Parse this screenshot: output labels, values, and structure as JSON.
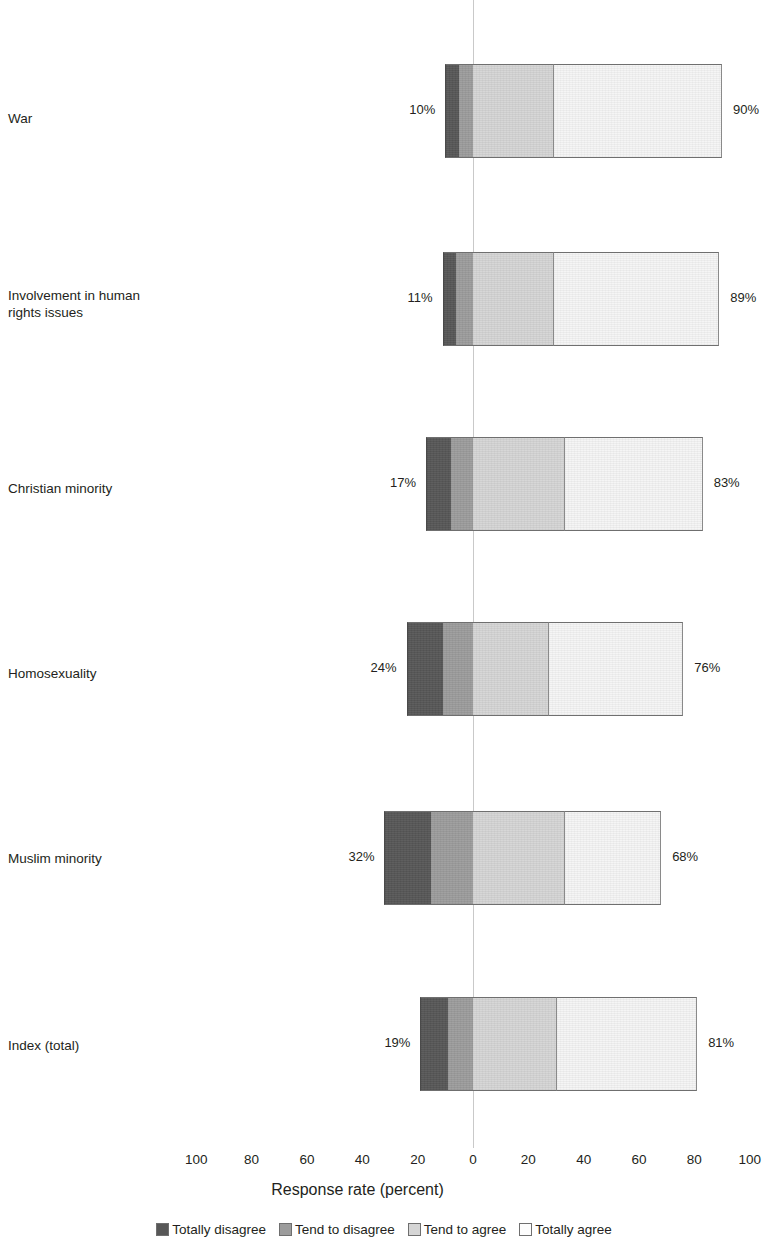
{
  "chart_data": {
    "type": "bar",
    "subtype": "diverging-stacked-bar",
    "title": "",
    "xlabel": "Response rate (percent)",
    "ylabel": "",
    "xlim": [
      -100,
      100
    ],
    "xticks": [
      "100",
      "80",
      "60",
      "40",
      "20",
      "0",
      "20",
      "40",
      "60",
      "80",
      "100"
    ],
    "grid": false,
    "zero_line": true,
    "legend_position": "bottom",
    "legend": [
      "Totally disagree",
      "Tend to disagree",
      "Tend to agree",
      "Totally agree"
    ],
    "colors": {
      "totally_disagree": "#575757",
      "tend_to_disagree": "#9c9c9c",
      "tend_to_agree": "#d5d5d5",
      "totally_agree": "#f5f5f5",
      "zero_line": "#c9c9c9",
      "text": "#231f20"
    },
    "categories": [
      "War",
      "Involvement in human\nrights issues",
      "Christian minority",
      "Homosexuality",
      "Muslim minority",
      "Index (total)"
    ],
    "series": [
      {
        "name": "Totally disagree",
        "values": [
          5,
          5,
          9,
          13,
          17,
          10
        ]
      },
      {
        "name": "Tend to disagree",
        "values": [
          5,
          6,
          8,
          11,
          15,
          9
        ]
      },
      {
        "name": "Tend to agree",
        "values": [
          29,
          29,
          33,
          27,
          33,
          30
        ]
      },
      {
        "name": "Totally agree",
        "values": [
          61,
          60,
          50,
          49,
          35,
          51
        ]
      }
    ],
    "rows": [
      {
        "label": "War",
        "disagree_total": "10%",
        "agree_total": "90%",
        "segments": [
          5,
          5,
          29,
          61
        ]
      },
      {
        "label": "Involvement in human\nrights issues",
        "disagree_total": "11%",
        "agree_total": "89%",
        "segments": [
          5,
          6,
          29,
          60
        ]
      },
      {
        "label": "Christian minority",
        "disagree_total": "17%",
        "agree_total": "83%",
        "segments": [
          9,
          8,
          33,
          50
        ]
      },
      {
        "label": "Homosexuality",
        "disagree_total": "24%",
        "agree_total": "76%",
        "segments": [
          13,
          11,
          27,
          49
        ]
      },
      {
        "label": "Muslim minority",
        "disagree_total": "32%",
        "agree_total": "68%",
        "segments": [
          17,
          15,
          33,
          35
        ]
      },
      {
        "label": "Index (total)",
        "disagree_total": "19%",
        "agree_total": "81%",
        "segments": [
          10,
          9,
          30,
          51
        ]
      }
    ]
  }
}
